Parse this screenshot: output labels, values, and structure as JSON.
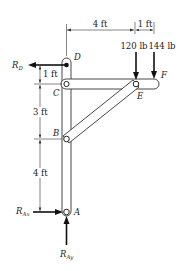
{
  "diagram": {
    "points": {
      "A": "A",
      "B": "B",
      "C": "C",
      "D": "D",
      "E": "E",
      "F": "F"
    },
    "dimensions": {
      "horizontal": [
        {
          "label": "4 ft",
          "from": "D",
          "to": "E"
        },
        {
          "label": "1 ft",
          "from": "E",
          "to": "F"
        }
      ],
      "vertical": [
        {
          "label": "1 ft",
          "from": "D",
          "to": "C"
        },
        {
          "label": "3 ft",
          "from": "C",
          "to": "B"
        },
        {
          "label": "4 ft",
          "from": "B",
          "to": "A"
        }
      ]
    },
    "loads": [
      {
        "label": "120 lb",
        "at": "E",
        "direction": "down"
      },
      {
        "label": "144 lb",
        "at": "F",
        "direction": "down"
      }
    ],
    "reactions": {
      "RD": {
        "main": "R",
        "sub": "D",
        "direction": "left"
      },
      "RAx": {
        "main": "R",
        "sub": "Ax",
        "direction": "right"
      },
      "RAy": {
        "main": "R",
        "sub": "Ay",
        "direction": "up"
      }
    },
    "members": [
      "vertical post A-D",
      "horizontal bar C-F",
      "diagonal strut B-E"
    ]
  }
}
